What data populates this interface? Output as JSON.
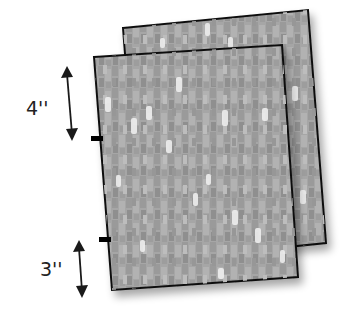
{
  "diagram": {
    "colors": {
      "fabric_base": "#a9a9a9",
      "fabric_dark": "#8c8c8c",
      "fabric_light": "#e8e8e8",
      "outline": "#111111",
      "arrow": "#1a1a1a",
      "marker": "#000000"
    },
    "measurements": [
      {
        "label": "4''",
        "position": "upper"
      },
      {
        "label": "3''",
        "position": "lower"
      }
    ]
  }
}
